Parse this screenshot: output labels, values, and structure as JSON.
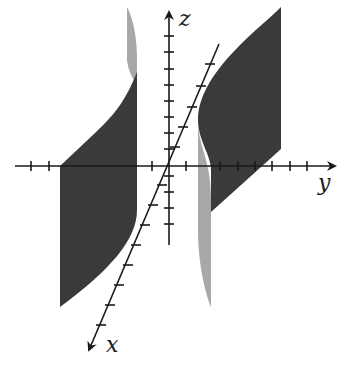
{
  "figure": {
    "type": "3d-surface-plot",
    "axes": {
      "x": {
        "label": "x"
      },
      "y": {
        "label": "y"
      },
      "z": {
        "label": "z"
      }
    },
    "colors": {
      "surface_dark": "#3a3a3a",
      "surface_light": "#a8a8a8",
      "axis": "#1a1a1a",
      "background": "#ffffff"
    }
  }
}
